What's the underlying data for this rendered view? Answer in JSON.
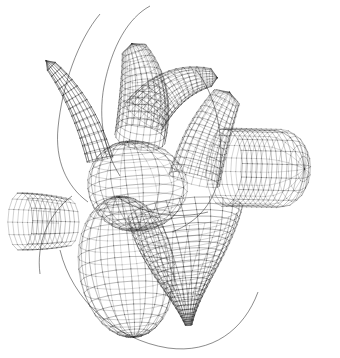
{
  "render": {
    "title": "3D Heart Wireframe Mesh",
    "subject": "anatomical-heart",
    "style": "wireframe",
    "shading": "none",
    "background_color": "#ffffff",
    "line_color": "#3a3a3a",
    "line_color_dark": "#141414",
    "line_color_light": "#9a9a9a",
    "line_width": 0.45,
    "width": 340,
    "height": 358,
    "projection": "perspective",
    "camera": {
      "azimuth_deg": -28,
      "elevation_deg": 14,
      "roll_deg": 6
    }
  },
  "parts": [
    {
      "id": "superior-vena-cava",
      "label": "Superior vena cava",
      "shape": "curved-tube",
      "u_divisions": 14,
      "v_divisions": 22,
      "cx": 168,
      "cy": 78,
      "color": "#3a3a3a"
    },
    {
      "id": "aortic-arch",
      "label": "Aortic arch",
      "shape": "curved-tapered-tube",
      "u_divisions": 14,
      "v_divisions": 24,
      "cx": 120,
      "cy": 96,
      "color": "#3a3a3a"
    },
    {
      "id": "pulmonary-trunk",
      "label": "Pulmonary trunk",
      "shape": "curved-tube",
      "u_divisions": 14,
      "v_divisions": 20,
      "cx": 196,
      "cy": 140,
      "color": "#3a3a3a"
    },
    {
      "id": "left-atrial-appendage",
      "label": "Left atrial appendage",
      "shape": "bulb",
      "u_divisions": 14,
      "v_divisions": 16,
      "cx": 64,
      "cy": 176,
      "color": "#3a3a3a"
    },
    {
      "id": "right-pulmonary-artery",
      "label": "Right pulmonary artery",
      "shape": "capped-cylinder",
      "u_divisions": 16,
      "v_divisions": 18,
      "cx": 258,
      "cy": 168,
      "length": 150,
      "radius": 37,
      "color": "#3a3a3a"
    },
    {
      "id": "right-atrium",
      "label": "Right atrium",
      "shape": "ellipsoid",
      "u_divisions": 16,
      "v_divisions": 18,
      "cx": 132,
      "cy": 186,
      "color": "#3a3a3a"
    },
    {
      "id": "ventricular-mass",
      "label": "Ventricular mass",
      "shape": "heart-cone",
      "u_divisions": 22,
      "v_divisions": 26,
      "cx": 182,
      "cy": 262,
      "color": "#3a3a3a"
    },
    {
      "id": "left-ventricle-lobe",
      "label": "Left ventricle lobe",
      "shape": "ellipsoid",
      "u_divisions": 18,
      "v_divisions": 20,
      "cx": 126,
      "cy": 262,
      "color": "#4a4a4a"
    },
    {
      "id": "inferior-vena-cava",
      "label": "Inferior vena cava",
      "shape": "short-tube",
      "u_divisions": 10,
      "v_divisions": 14,
      "cx": 46,
      "cy": 222,
      "color": "#3a3a3a"
    }
  ],
  "legend": {
    "visible": false,
    "entries": []
  },
  "overlay": {
    "visible": false,
    "text": ""
  }
}
